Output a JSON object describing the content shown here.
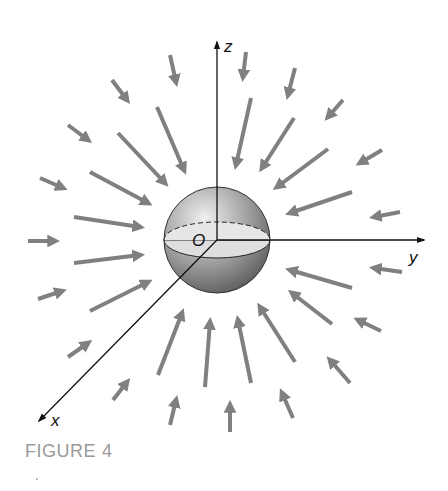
{
  "figure": {
    "caption_label": "FIGURE",
    "caption_number": "4",
    "colors": {
      "arrow": "#808080",
      "axis": "#111111",
      "sphere_dark": "#6e6e6e",
      "sphere_light": "#e4e4e4",
      "equator_fill": "#dcdcdc",
      "caption": "#9a9a9a"
    }
  },
  "axes": {
    "z_label": "z",
    "y_label": "y",
    "x_label": "x",
    "origin_label": "O"
  },
  "sphere": {
    "cx": 217,
    "cy": 240,
    "r": 53
  },
  "field": {
    "description": "Radial vector field pointing inward toward the origin",
    "long_arrows": [
      [
        157,
        107,
        184,
        170
      ],
      [
        118,
        133,
        165,
        183
      ],
      [
        90,
        172,
        148,
        203
      ],
      [
        74,
        217,
        140,
        227
      ],
      [
        74,
        263,
        140,
        255
      ],
      [
        90,
        311,
        148,
        282
      ],
      [
        158,
        375,
        182,
        313
      ],
      [
        205,
        387,
        210,
        322
      ],
      [
        251,
        383,
        238,
        320
      ],
      [
        295,
        362,
        260,
        307
      ],
      [
        332,
        324,
        292,
        293
      ],
      [
        352,
        288,
        290,
        270
      ],
      [
        352,
        192,
        290,
        213
      ],
      [
        328,
        149,
        277,
        187
      ],
      [
        294,
        118,
        262,
        168
      ],
      [
        251,
        98,
        236,
        165
      ]
    ],
    "short_arrows": [
      [
        170,
        55,
        176,
        82
      ],
      [
        112,
        80,
        127,
        100
      ],
      [
        68,
        125,
        88,
        140
      ],
      [
        40,
        178,
        63,
        188
      ],
      [
        28,
        241,
        55,
        241
      ],
      [
        38,
        299,
        62,
        291
      ],
      [
        68,
        357,
        88,
        343
      ],
      [
        113,
        400,
        127,
        382
      ],
      [
        170,
        425,
        176,
        400
      ],
      [
        230,
        432,
        230,
        405
      ],
      [
        293,
        418,
        282,
        393
      ],
      [
        350,
        383,
        330,
        360
      ],
      [
        381,
        331,
        358,
        320
      ],
      [
        402,
        272,
        374,
        268
      ],
      [
        400,
        212,
        374,
        217
      ],
      [
        382,
        150,
        360,
        163
      ],
      [
        343,
        100,
        328,
        117
      ],
      [
        295,
        68,
        288,
        95
      ],
      [
        246,
        52,
        243,
        77
      ]
    ]
  }
}
